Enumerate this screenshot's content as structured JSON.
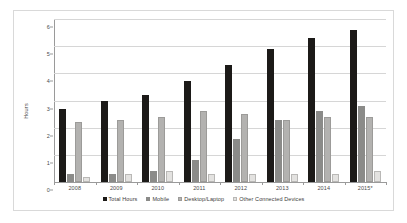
{
  "chart_data": {
    "type": "bar",
    "title": "",
    "xlabel": "",
    "ylabel": "Hours",
    "ylim": [
      0,
      6
    ],
    "ytick_values": [
      0,
      1,
      2,
      3,
      4,
      5,
      6
    ],
    "ytick_labels": [
      "0",
      "1",
      "2",
      "3",
      "4",
      "5",
      "6"
    ],
    "grid": true,
    "legend_position": "bottom",
    "categories": [
      "2008",
      "2009",
      "2010",
      "2011",
      "2012",
      "2013",
      "2014",
      "2015*"
    ],
    "series": [
      {
        "name": "Total Hours",
        "color": "#1c1a18",
        "values": [
          2.7,
          3.0,
          3.2,
          3.7,
          4.3,
          4.9,
          5.3,
          5.6
        ]
      },
      {
        "name": "Mobile",
        "color": "#8b8b89",
        "values": [
          0.3,
          0.3,
          0.4,
          0.8,
          1.6,
          2.3,
          2.6,
          2.8
        ]
      },
      {
        "name": "Desktop/Laptop",
        "color": "#b3b2b0",
        "values": [
          2.2,
          2.3,
          2.4,
          2.6,
          2.5,
          2.3,
          2.4,
          2.4
        ]
      },
      {
        "name": "Other Connected Devices",
        "color": "#e3e2e0",
        "values": [
          0.2,
          0.3,
          0.4,
          0.3,
          0.3,
          0.3,
          0.3,
          0.4
        ]
      }
    ]
  }
}
